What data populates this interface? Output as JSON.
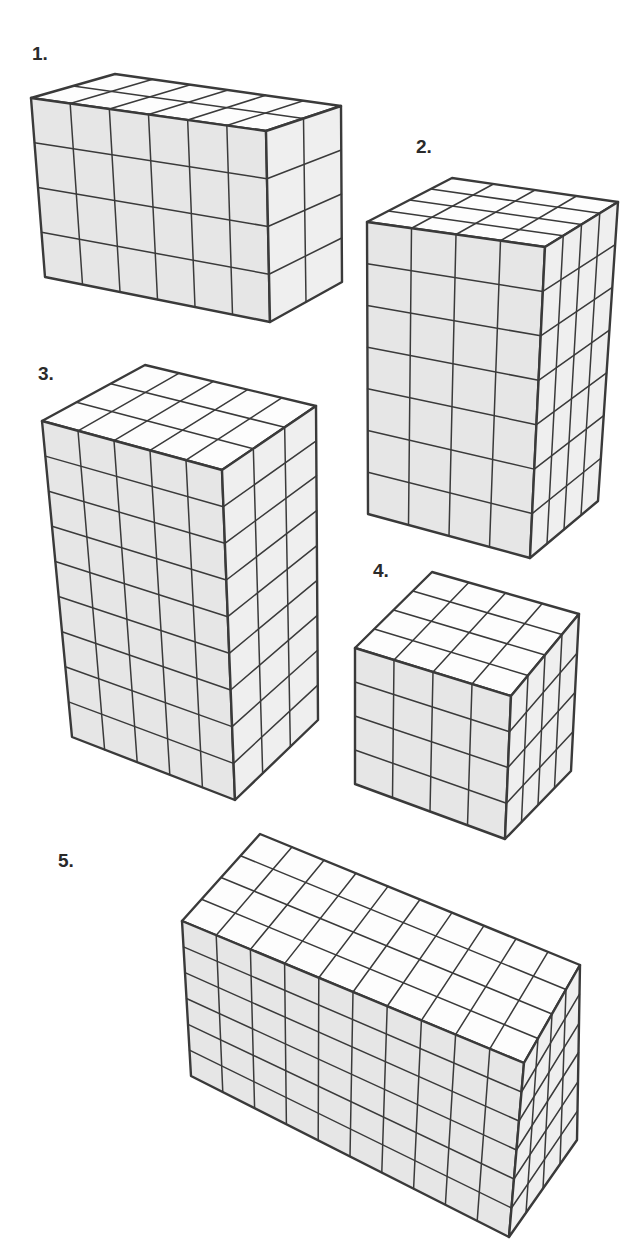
{
  "figures": [
    {
      "label": "1.",
      "label_pos": [
        32,
        55
      ],
      "dims": {
        "length": 6,
        "depth": 2,
        "height": 4
      },
      "unit_cubes": 48,
      "corners": {
        "front_top_left": [
          31,
          98
        ],
        "front_top_right": [
          266,
          131
        ],
        "front_bottom_left": [
          45,
          277
        ],
        "front_bottom_right": [
          270,
          322
        ],
        "back_top_left": [
          115,
          74
        ],
        "back_top_right": [
          341,
          106
        ],
        "back_bottom_right": [
          342,
          282
        ]
      }
    },
    {
      "label": "2.",
      "label_pos": [
        416,
        148
      ],
      "dims": {
        "length": 4,
        "depth": 4,
        "height": 7
      },
      "unit_cubes": 112,
      "corners": {
        "front_top_left": [
          367,
          222
        ],
        "front_top_right": [
          545,
          247
        ],
        "front_bottom_left": [
          368,
          514
        ],
        "front_bottom_right": [
          530,
          558
        ],
        "back_top_left": [
          452,
          178
        ],
        "back_top_right": [
          618,
          202
        ],
        "back_bottom_right": [
          598,
          501
        ]
      }
    },
    {
      "label": "3.",
      "label_pos": [
        38,
        375
      ],
      "dims": {
        "length": 5,
        "depth": 3,
        "height": 9
      },
      "unit_cubes": 135,
      "corners": {
        "front_top_left": [
          42,
          421
        ],
        "front_top_right": [
          222,
          470
        ],
        "front_bottom_left": [
          72,
          737
        ],
        "front_bottom_right": [
          235,
          800
        ],
        "back_top_left": [
          145,
          365
        ],
        "back_top_right": [
          316,
          406
        ],
        "back_bottom_right": [
          318,
          720
        ]
      }
    },
    {
      "label": "4.",
      "label_pos": [
        373,
        572
      ],
      "dims": {
        "length": 4,
        "depth": 4,
        "height": 4
      },
      "unit_cubes": 64,
      "corners": {
        "front_top_left": [
          355,
          648
        ],
        "front_top_right": [
          511,
          696
        ],
        "front_bottom_left": [
          355,
          784
        ],
        "front_bottom_right": [
          505,
          839
        ],
        "back_top_left": [
          432,
          572
        ],
        "back_top_right": [
          579,
          614
        ],
        "back_bottom_right": [
          571,
          771
        ]
      }
    },
    {
      "label": "5.",
      "label_pos": [
        58,
        862
      ],
      "dims": {
        "length": 10,
        "depth": 4,
        "height": 6
      },
      "unit_cubes": 240,
      "corners": {
        "front_top_left": [
          182,
          921
        ],
        "front_top_right": [
          524,
          1063
        ],
        "front_bottom_left": [
          191,
          1076
        ],
        "front_bottom_right": [
          509,
          1237
        ],
        "back_top_left": [
          260,
          834
        ],
        "back_top_right": [
          580,
          965
        ],
        "back_bottom_right": [
          577,
          1140
        ]
      }
    }
  ],
  "colors": {
    "line": "#3a3a3a",
    "front_face": "#e6e6e6",
    "side_face": "#efefef",
    "top_face": "#fdfdfd",
    "label": "#2a2a2a"
  }
}
